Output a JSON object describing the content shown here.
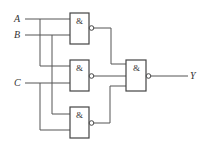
{
  "diagram": {
    "type": "logic-circuit",
    "inputs": [
      {
        "label": "A",
        "y": 19
      },
      {
        "label": "B",
        "y": 35
      },
      {
        "label": "C",
        "y": 83
      }
    ],
    "output": {
      "label": "Y"
    },
    "gates": [
      {
        "id": "g1",
        "symbol": "&",
        "type": "NAND",
        "inputs": [
          "A",
          "B"
        ]
      },
      {
        "id": "g2",
        "symbol": "&",
        "type": "NAND",
        "inputs": [
          "A",
          "C"
        ]
      },
      {
        "id": "g3",
        "symbol": "&",
        "type": "NAND",
        "inputs": [
          "B",
          "C"
        ]
      },
      {
        "id": "g4",
        "symbol": "&",
        "type": "NAND",
        "inputs": [
          "g1",
          "g2",
          "g3"
        ]
      }
    ]
  }
}
